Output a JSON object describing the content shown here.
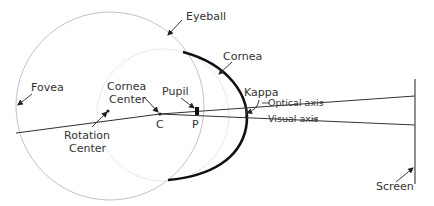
{
  "diagram": {
    "labels": {
      "eyeball": "Eyeball",
      "cornea": "Cornea",
      "fovea": "Fovea",
      "cornea_center_line1": "Cornea",
      "cornea_center_line2": "Center",
      "pupil": "Pupil",
      "kappa": "Kappa",
      "optical_axis": "Optical axis",
      "visual_axis": "Visual axis",
      "rotation_center_line1": "Rotation",
      "rotation_center_line2": "Center",
      "point_c": "C",
      "point_p": "P",
      "screen": "Screen"
    },
    "colors": {
      "eyeball_outline": "#bbbbbb",
      "cornea_sphere_outline": "#cccccc",
      "cornea_arc": "#111111",
      "axis_lines": "#333333",
      "text": "#333333"
    }
  }
}
